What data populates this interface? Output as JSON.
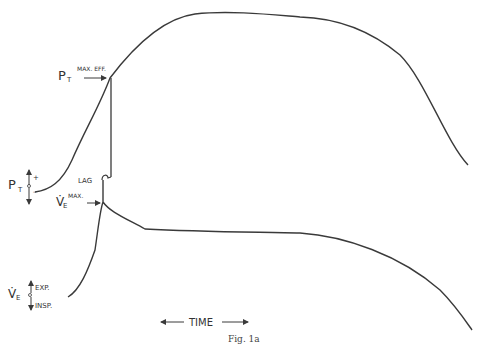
{
  "figure": {
    "caption": "Fig. 1a",
    "time_axis_label": "TIME",
    "curves": [
      {
        "id": "pt",
        "symbol": "P",
        "subscript": "T",
        "name": "Transpulmonary pressure"
      },
      {
        "id": "ve",
        "symbol": "V̇",
        "subscript": "E",
        "name": "Flow"
      }
    ],
    "labels": {
      "pt_symbol": "P",
      "pt_sub": "T",
      "pt_plus": "+",
      "pt_zero": "o",
      "pt_minus": "–",
      "pt_max_eff_symbol": "P",
      "pt_max_eff_sub": "T",
      "pt_max_eff_sup": "MAX. EFF.",
      "lag": "LAG",
      "ve_max_symbol": "V̇",
      "ve_max_sub": "E",
      "ve_max_sup": "MAX.",
      "ve_symbol": "V̇",
      "ve_sub": "E",
      "ve_exp": "EXP.",
      "ve_insp": "INSP."
    },
    "colors": {
      "line": "#3a3a3a",
      "text": "#333333"
    }
  }
}
